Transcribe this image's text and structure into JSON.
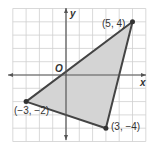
{
  "diagram": {
    "axes": {
      "x_label": "x",
      "y_label": "y",
      "origin_label": "O"
    },
    "grid": {
      "x_min": -4,
      "x_max": 6,
      "y_min": -5,
      "y_max": 5
    },
    "triangle": {
      "fill": "#d4d4d4",
      "stroke": "#444444",
      "vertices": [
        {
          "x": 5,
          "y": 4,
          "label": "(5, 4)"
        },
        {
          "x": -3,
          "y": -2,
          "label": "(−3, −2)"
        },
        {
          "x": 3,
          "y": -4,
          "label": "(3, −4)"
        }
      ]
    }
  }
}
